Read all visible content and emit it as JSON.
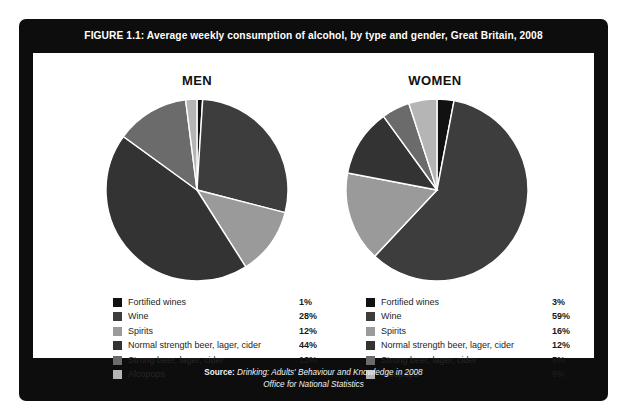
{
  "figure": {
    "title": "FIGURE 1.1: Average weekly consumption of alcohol, by type and gender, Great Britain, 2008",
    "source_label": "Source:",
    "source_line1": " Drinking: Adults' Behaviour and Knowledge in 2008",
    "source_line2": "Office for National Statistics",
    "frame_color": "#0d0d0d",
    "panel_color": "#ffffff"
  },
  "headings": {
    "men": "MEN",
    "women": "WOMEN"
  },
  "palette": {
    "fortified_wines": "#111111",
    "wine": "#3d3d3d",
    "spirits": "#9a9a9a",
    "normal_strength_beer": "#333333",
    "strong_beer": "#6b6b6b",
    "alcopops": "#b5b5b5",
    "slice_divider": "#ffffff"
  },
  "chart_data": [
    {
      "type": "pie",
      "title": "MEN",
      "categories": [
        "Fortified wines",
        "Wine",
        "Spirits",
        "Normal strength beer, lager, cider",
        "Strong beer, lager, cider",
        "Alcopops"
      ],
      "values": [
        1,
        28,
        12,
        44,
        13,
        2
      ],
      "value_labels": [
        "1%",
        "28%",
        "12%",
        "44%",
        "13%",
        "2%"
      ],
      "unit": "%",
      "colors": [
        "#111111",
        "#3d3d3d",
        "#9a9a9a",
        "#333333",
        "#6b6b6b",
        "#b5b5b5"
      ],
      "start_angle_deg": 0,
      "direction": "clockwise",
      "legend_position": "below"
    },
    {
      "type": "pie",
      "title": "WOMEN",
      "categories": [
        "Fortified wines",
        "Wine",
        "Spirits",
        "Normal strength beer, lager, cider",
        "Strong beer, lager, cider",
        "Alcopops"
      ],
      "values": [
        3,
        59,
        16,
        12,
        5,
        5
      ],
      "value_labels": [
        "3%",
        "59%",
        "16%",
        "12%",
        "5%",
        "5%"
      ],
      "unit": "%",
      "colors": [
        "#111111",
        "#3d3d3d",
        "#9a9a9a",
        "#333333",
        "#6b6b6b",
        "#b5b5b5"
      ],
      "start_angle_deg": 0,
      "direction": "clockwise",
      "legend_position": "below"
    }
  ],
  "legends": {
    "men": [
      {
        "label": "Fortified wines",
        "value": "1%",
        "color": "#111111"
      },
      {
        "label": "Wine",
        "value": "28%",
        "color": "#3d3d3d"
      },
      {
        "label": "Spirits",
        "value": "12%",
        "color": "#9a9a9a"
      },
      {
        "label": "Normal strength beer, lager, cider",
        "value": "44%",
        "color": "#333333"
      },
      {
        "label": "Strong beer, lager, cider",
        "value": "13%",
        "color": "#6b6b6b"
      },
      {
        "label": "Alcopops",
        "value": "2%",
        "color": "#b5b5b5"
      }
    ],
    "women": [
      {
        "label": "Fortified wines",
        "value": "3%",
        "color": "#111111"
      },
      {
        "label": "Wine",
        "value": "59%",
        "color": "#3d3d3d"
      },
      {
        "label": "Spirits",
        "value": "16%",
        "color": "#9a9a9a"
      },
      {
        "label": "Normal strength beer, lager, cider",
        "value": "12%",
        "color": "#333333"
      },
      {
        "label": "Strong beer, lager, cider",
        "value": "5%",
        "color": "#6b6b6b"
      },
      {
        "label": "Alcopops",
        "value": "5%",
        "color": "#b5b5b5"
      }
    ]
  }
}
